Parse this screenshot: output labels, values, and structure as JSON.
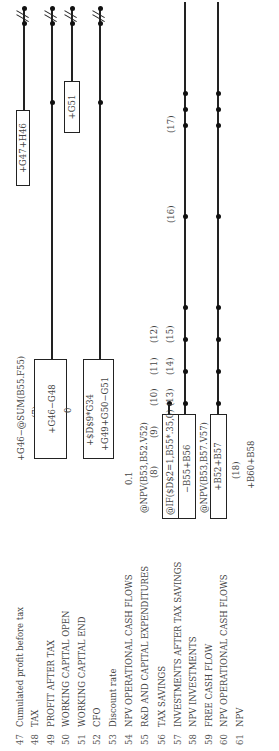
{
  "rows": [
    {
      "num": "47",
      "label": "Cumulated profit before tax"
    },
    {
      "num": "48",
      "label": "TAX"
    },
    {
      "num": "49",
      "label": "PROFIT AFTER TAX"
    },
    {
      "num": "50",
      "label": "WORKING CAPITAL OPEN"
    },
    {
      "num": "51",
      "label": "WORKING CAPITAL END"
    },
    {
      "num": "52",
      "label": "CFO"
    },
    {
      "num": "53",
      "label": "Discount rate"
    },
    {
      "num": "54",
      "label": "NPV OPERATIONAL CASH FLOWS"
    },
    {
      "num": "55",
      "label": "R&D AND CAPITAL EXPENDITURES"
    },
    {
      "num": "56",
      "label": "TAX SAVINGS"
    },
    {
      "num": "57",
      "label": "INVESTMENTS AFTER TAX SAVINGS"
    },
    {
      "num": "58",
      "label": "NPV INVESTMENTS"
    },
    {
      "num": "59",
      "label": "FREE CASH FLOW"
    },
    {
      "num": "60",
      "label": "NPV OPERATIONAL CASH FLOWS"
    },
    {
      "num": "61",
      "label": "NPV"
    }
  ],
  "formulas": {
    "cum_profit_first": "+G46−@SUM(B55.F55)",
    "cum_profit_next": "+G47+H46",
    "tax_ref": "(7)",
    "profit_after_tax": "+G46−G48",
    "wc_open_next": "+G51",
    "wc_open_first": "0",
    "wc_end": "+$D$9*G34",
    "cfo": "+G49+G50−G51",
    "discount_rate": "0.1",
    "npv_op_cf": "@NPV(B53,B52.V52)",
    "rd_ref": "(8)",
    "tax_savings": "@IF($D$2=1,B55*.35,0)",
    "inv_after_tax": "−B55+B56",
    "npv_investments": "@NPV(B53,B57.V57)",
    "free_cash_flow": "+B52+B57",
    "npv_op_ref": "(18)",
    "npv": "+B60+B58"
  },
  "refs": {
    "r9": "(9)",
    "r10": "(10)",
    "r11": "(11)",
    "r12": "(12)",
    "r13": "(13)",
    "r14": "(14)",
    "r15": "(15)",
    "r16": "(16)",
    "r17": "(17)"
  }
}
